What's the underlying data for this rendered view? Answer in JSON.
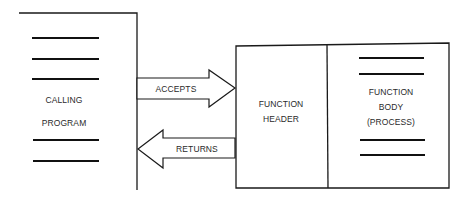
{
  "diagram": {
    "calling_program": {
      "label_line1": "CALLING",
      "label_line2": "PROGRAM",
      "dash_count": 5
    },
    "arrows": {
      "accepts": {
        "label": "ACCEPTS",
        "direction": "right"
      },
      "returns": {
        "label": "RETURNS",
        "direction": "left"
      }
    },
    "function_header": {
      "label_line1": "FUNCTION",
      "label_line2": "HEADER"
    },
    "function_body": {
      "label_line1": "FUNCTION",
      "label_line2": "BODY",
      "label_line3": "(PROCESS)",
      "dash_count": 4
    },
    "colors": {
      "line": "#1a1a1a",
      "text": "#2a2a2a",
      "background": "#ffffff"
    }
  }
}
